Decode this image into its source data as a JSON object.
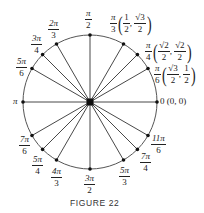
{
  "figure": {
    "caption": "FIGURE 22",
    "center": [
      90,
      102
    ],
    "radius": 67,
    "angles": [
      {
        "id": "0",
        "label_num": "0",
        "label_den": "",
        "coord": "(0, 0)",
        "deg": 0
      },
      {
        "id": "pi6",
        "label_num": "π",
        "label_den": "6",
        "coord_x_num": "√3",
        "coord_x_den": "2",
        "coord_y_num": "1",
        "coord_y_den": "2",
        "deg": 30
      },
      {
        "id": "pi4",
        "label_num": "π",
        "label_den": "4",
        "coord_x_num": "√2",
        "coord_x_den": "2",
        "coord_y_num": "√2",
        "coord_y_den": "2",
        "deg": 45
      },
      {
        "id": "pi3",
        "label_num": "π",
        "label_den": "3",
        "coord_x_num": "1",
        "coord_x_den": "2",
        "coord_y_num": "√3",
        "coord_y_den": "2",
        "deg": 60
      },
      {
        "id": "pi2",
        "label_num": "π",
        "label_den": "2",
        "deg": 90
      },
      {
        "id": "2pi3",
        "label_num": "2π",
        "label_den": "3",
        "deg": 120
      },
      {
        "id": "3pi4",
        "label_num": "3π",
        "label_den": "4",
        "deg": 135
      },
      {
        "id": "5pi6",
        "label_num": "5π",
        "label_den": "6",
        "deg": 150
      },
      {
        "id": "pi",
        "label_num": "π",
        "label_den": "",
        "deg": 180
      },
      {
        "id": "7pi6",
        "label_num": "7π",
        "label_den": "6",
        "deg": 210
      },
      {
        "id": "5pi4",
        "label_num": "5π",
        "label_den": "4",
        "deg": 225
      },
      {
        "id": "4pi3",
        "label_num": "4π",
        "label_den": "3",
        "deg": 240
      },
      {
        "id": "3pi2",
        "label_num": "3π",
        "label_den": "2",
        "deg": 270
      },
      {
        "id": "5pi3",
        "label_num": "5π",
        "label_den": "3",
        "deg": 300
      },
      {
        "id": "7pi4",
        "label_num": "7π",
        "label_den": "4",
        "deg": 315
      },
      {
        "id": "11pi6",
        "label_num": "11π",
        "label_den": "6",
        "deg": 330
      }
    ],
    "colors": {
      "stroke": "#333333",
      "dot": "#111111",
      "text": "#222222"
    }
  }
}
